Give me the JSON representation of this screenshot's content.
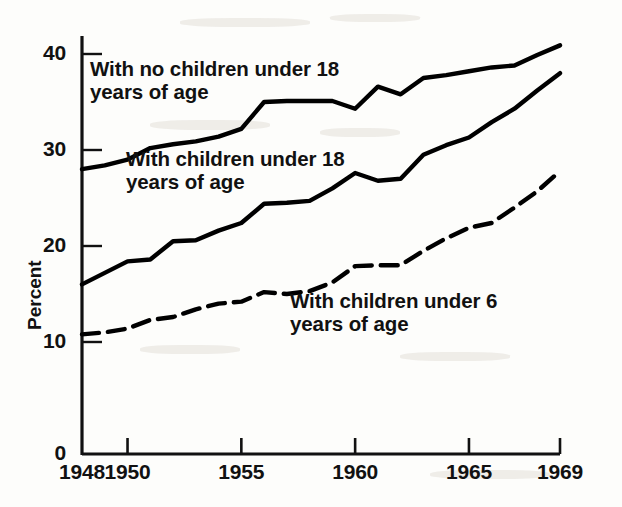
{
  "chart_data": {
    "type": "line",
    "title": "",
    "subtitle": "",
    "xlabel": "",
    "ylabel": "Percent",
    "xlim": [
      1948,
      1969
    ],
    "ylim": [
      0,
      43
    ],
    "grid": false,
    "legend_position": "inline-annotations",
    "x": [
      1948,
      1949,
      1950,
      1951,
      1952,
      1953,
      1954,
      1955,
      1956,
      1957,
      1958,
      1959,
      1960,
      1961,
      1962,
      1963,
      1964,
      1965,
      1966,
      1967,
      1968,
      1969
    ],
    "yticks": [
      0,
      10,
      20,
      30,
      40
    ],
    "ytick_labels": [
      "0",
      "10",
      "20",
      "30",
      "40"
    ],
    "xticks": [
      1948,
      1950,
      1955,
      1960,
      1965,
      1969
    ],
    "xtick_labels": [
      "1948",
      "1950",
      "1955",
      "1960",
      "1965",
      "1969"
    ],
    "series": [
      {
        "name": "With no children under 18 years of age",
        "label_line1": "With no children under 18",
        "label_line2": "years of age",
        "style": "solid",
        "color": "#000000",
        "values": [
          28.0,
          28.4,
          29.0,
          30.2,
          30.6,
          30.9,
          31.4,
          32.2,
          35.0,
          35.1,
          35.1,
          35.1,
          34.3,
          36.6,
          35.8,
          37.5,
          37.8,
          38.2,
          38.6,
          38.8,
          39.9,
          40.9
        ]
      },
      {
        "name": "With children under 18 years of age",
        "label_line1": "With children under 18",
        "label_line2": "years of age",
        "style": "solid",
        "color": "#000000",
        "values": [
          16.0,
          17.2,
          18.4,
          18.6,
          20.5,
          20.6,
          21.6,
          22.4,
          24.4,
          24.5,
          24.7,
          26.0,
          27.6,
          26.8,
          27.0,
          29.5,
          30.5,
          31.3,
          32.9,
          34.3,
          36.2,
          38.0
        ]
      },
      {
        "name": "With children under 6 years of age",
        "label_line1": "With children under 6",
        "label_line2": "years of age",
        "style": "dashed",
        "color": "#000000",
        "values": [
          10.8,
          11.0,
          11.4,
          12.3,
          12.6,
          13.4,
          14.0,
          14.2,
          15.2,
          15.0,
          15.3,
          16.2,
          17.9,
          18.0,
          18.0,
          19.5,
          20.8,
          21.9,
          22.4,
          24.0,
          25.7,
          27.8
        ]
      }
    ],
    "annotations": [
      {
        "text_line1": "With no children under 18",
        "text_line2": "years of age",
        "x_px": 90,
        "y_px": 58
      },
      {
        "text_line1": "With children under 18",
        "text_line2": "years of age",
        "x_px": 126,
        "y_px": 148
      },
      {
        "text_line1": "With children under 6",
        "text_line2": "years of age",
        "x_px": 290,
        "y_px": 290
      }
    ]
  }
}
